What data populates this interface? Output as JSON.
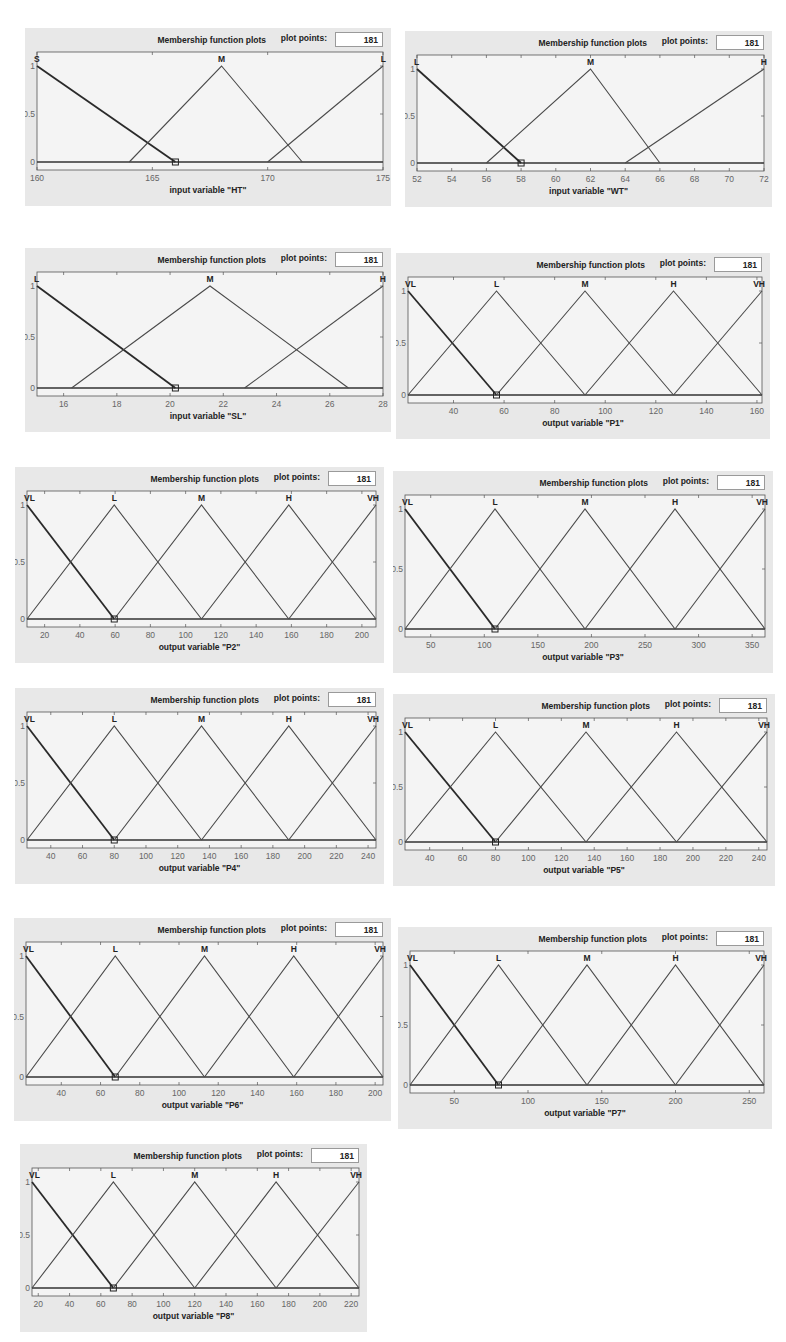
{
  "panel_common": {
    "header_title": "Membership function plots",
    "plot_points_label": "plot points:",
    "plot_points_value": "181"
  },
  "colors": {
    "panel_bg": "#e8e8e8",
    "plot_bg": "#f4f4f4",
    "line": "#4a4a4a",
    "text": "#222222"
  },
  "chart_data": [
    {
      "type": "line",
      "title": "Membership function plots",
      "xlabel": "input variable \"HT\"",
      "ylabel": "",
      "xlim": [
        160,
        175
      ],
      "ylim": [
        0,
        1
      ],
      "xticks": [
        160,
        165,
        170,
        175
      ],
      "yticks": [
        0,
        0.5,
        1
      ],
      "series": [
        {
          "name": "S",
          "points": [
            [
              160,
              1
            ],
            [
              166,
              0
            ]
          ]
        },
        {
          "name": "M",
          "points": [
            [
              164,
              0
            ],
            [
              168,
              1
            ],
            [
              171.5,
              0
            ]
          ]
        },
        {
          "name": "L",
          "points": [
            [
              170,
              0
            ],
            [
              175,
              1
            ]
          ]
        }
      ]
    },
    {
      "type": "line",
      "title": "Membership function plots",
      "xlabel": "input variable \"WT\"",
      "ylabel": "",
      "xlim": [
        52,
        72
      ],
      "ylim": [
        0,
        1
      ],
      "xticks": [
        52,
        54,
        56,
        58,
        60,
        62,
        64,
        66,
        68,
        70,
        72
      ],
      "yticks": [
        0,
        0.5,
        1
      ],
      "series": [
        {
          "name": "L",
          "points": [
            [
              52,
              1
            ],
            [
              58,
              0
            ]
          ]
        },
        {
          "name": "M",
          "points": [
            [
              56,
              0
            ],
            [
              62,
              1
            ],
            [
              66,
              0
            ]
          ]
        },
        {
          "name": "H",
          "points": [
            [
              64,
              0
            ],
            [
              72,
              1
            ]
          ]
        }
      ]
    },
    {
      "type": "line",
      "title": "Membership function plots",
      "xlabel": "input variable \"SL\"",
      "ylabel": "",
      "xlim": [
        15,
        28
      ],
      "ylim": [
        0,
        1
      ],
      "xticks": [
        16,
        18,
        20,
        22,
        24,
        26,
        28
      ],
      "yticks": [
        0,
        0.5,
        1
      ],
      "series": [
        {
          "name": "L",
          "points": [
            [
              15,
              1
            ],
            [
              20.2,
              0
            ]
          ]
        },
        {
          "name": "M",
          "points": [
            [
              16.3,
              0
            ],
            [
              21.5,
              1
            ],
            [
              26.7,
              0
            ]
          ]
        },
        {
          "name": "H",
          "points": [
            [
              22.8,
              0
            ],
            [
              28,
              1
            ]
          ]
        }
      ]
    },
    {
      "type": "line",
      "title": "Membership function plots",
      "xlabel": "output variable \"P1\"",
      "ylabel": "",
      "xlim": [
        22,
        162
      ],
      "ylim": [
        0,
        1
      ],
      "xticks": [
        40,
        60,
        80,
        100,
        120,
        140,
        160
      ],
      "yticks": [
        0,
        0.5,
        1
      ],
      "series": [
        {
          "name": "VL",
          "points": [
            [
              22,
              1
            ],
            [
              57,
              0
            ]
          ]
        },
        {
          "name": "L",
          "points": [
            [
              22,
              0
            ],
            [
              57,
              1
            ],
            [
              92,
              0
            ]
          ]
        },
        {
          "name": "M",
          "points": [
            [
              57,
              0
            ],
            [
              92,
              1
            ],
            [
              127,
              0
            ]
          ]
        },
        {
          "name": "H",
          "points": [
            [
              92,
              0
            ],
            [
              127,
              1
            ],
            [
              162,
              0
            ]
          ]
        },
        {
          "name": "VH",
          "points": [
            [
              127,
              0
            ],
            [
              162,
              1
            ]
          ]
        }
      ]
    },
    {
      "type": "line",
      "title": "Membership function plots",
      "xlabel": "output variable \"P2\"",
      "ylabel": "",
      "xlim": [
        10,
        208
      ],
      "ylim": [
        0,
        1
      ],
      "xticks": [
        20,
        40,
        60,
        80,
        100,
        120,
        140,
        160,
        180,
        200
      ],
      "yticks": [
        0,
        0.5,
        1
      ],
      "series": [
        {
          "name": "VL",
          "points": [
            [
              10,
              1
            ],
            [
              59.5,
              0
            ]
          ]
        },
        {
          "name": "L",
          "points": [
            [
              10,
              0
            ],
            [
              59.5,
              1
            ],
            [
              109,
              0
            ]
          ]
        },
        {
          "name": "M",
          "points": [
            [
              59.5,
              0
            ],
            [
              109,
              1
            ],
            [
              158.5,
              0
            ]
          ]
        },
        {
          "name": "H",
          "points": [
            [
              109,
              0
            ],
            [
              158.5,
              1
            ],
            [
              208,
              0
            ]
          ]
        },
        {
          "name": "VH",
          "points": [
            [
              158.5,
              0
            ],
            [
              208,
              1
            ]
          ]
        }
      ]
    },
    {
      "type": "line",
      "title": "Membership function plots",
      "xlabel": "output variable \"P3\"",
      "ylabel": "",
      "xlim": [
        26,
        362
      ],
      "ylim": [
        0,
        1
      ],
      "xticks": [
        50,
        100,
        150,
        200,
        250,
        300,
        350
      ],
      "yticks": [
        0,
        0.5,
        1
      ],
      "series": [
        {
          "name": "VL",
          "points": [
            [
              26,
              1
            ],
            [
              110,
              0
            ]
          ]
        },
        {
          "name": "L",
          "points": [
            [
              26,
              0
            ],
            [
              110,
              1
            ],
            [
              194,
              0
            ]
          ]
        },
        {
          "name": "M",
          "points": [
            [
              110,
              0
            ],
            [
              194,
              1
            ],
            [
              278,
              0
            ]
          ]
        },
        {
          "name": "H",
          "points": [
            [
              194,
              0
            ],
            [
              278,
              1
            ],
            [
              362,
              0
            ]
          ]
        },
        {
          "name": "VH",
          "points": [
            [
              278,
              0
            ],
            [
              362,
              1
            ]
          ]
        }
      ]
    },
    {
      "type": "line",
      "title": "Membership function plots",
      "xlabel": "output variable \"P4\"",
      "ylabel": "",
      "xlim": [
        25,
        245
      ],
      "ylim": [
        0,
        1
      ],
      "xticks": [
        40,
        60,
        80,
        100,
        120,
        140,
        160,
        180,
        200,
        220,
        240
      ],
      "yticks": [
        0,
        0.5,
        1
      ],
      "series": [
        {
          "name": "VL",
          "points": [
            [
              25,
              1
            ],
            [
              80,
              0
            ]
          ]
        },
        {
          "name": "L",
          "points": [
            [
              25,
              0
            ],
            [
              80,
              1
            ],
            [
              135,
              0
            ]
          ]
        },
        {
          "name": "M",
          "points": [
            [
              80,
              0
            ],
            [
              135,
              1
            ],
            [
              190,
              0
            ]
          ]
        },
        {
          "name": "H",
          "points": [
            [
              135,
              0
            ],
            [
              190,
              1
            ],
            [
              245,
              0
            ]
          ]
        },
        {
          "name": "VH",
          "points": [
            [
              190,
              0
            ],
            [
              245,
              1
            ]
          ]
        }
      ]
    },
    {
      "type": "line",
      "title": "Membership function plots",
      "xlabel": "output variable \"P5\"",
      "ylabel": "",
      "xlim": [
        25,
        245
      ],
      "ylim": [
        0,
        1
      ],
      "xticks": [
        40,
        60,
        80,
        100,
        120,
        140,
        160,
        180,
        200,
        220,
        240
      ],
      "yticks": [
        0,
        0.5,
        1
      ],
      "series": [
        {
          "name": "VL",
          "points": [
            [
              25,
              1
            ],
            [
              80,
              0
            ]
          ]
        },
        {
          "name": "L",
          "points": [
            [
              25,
              0
            ],
            [
              80,
              1
            ],
            [
              135,
              0
            ]
          ]
        },
        {
          "name": "M",
          "points": [
            [
              80,
              0
            ],
            [
              135,
              1
            ],
            [
              190,
              0
            ]
          ]
        },
        {
          "name": "H",
          "points": [
            [
              135,
              0
            ],
            [
              190,
              1
            ],
            [
              245,
              0
            ]
          ]
        },
        {
          "name": "VH",
          "points": [
            [
              190,
              0
            ],
            [
              245,
              1
            ]
          ]
        }
      ]
    },
    {
      "type": "line",
      "title": "Membership function plots",
      "xlabel": "output variable \"P6\"",
      "ylabel": "",
      "xlim": [
        22,
        204
      ],
      "ylim": [
        0,
        1
      ],
      "xticks": [
        40,
        60,
        80,
        100,
        120,
        140,
        160,
        180,
        200
      ],
      "yticks": [
        0,
        0.5,
        1
      ],
      "series": [
        {
          "name": "VL",
          "points": [
            [
              22,
              1
            ],
            [
              67.5,
              0
            ]
          ]
        },
        {
          "name": "L",
          "points": [
            [
              22,
              0
            ],
            [
              67.5,
              1
            ],
            [
              113,
              0
            ]
          ]
        },
        {
          "name": "M",
          "points": [
            [
              67.5,
              0
            ],
            [
              113,
              1
            ],
            [
              158.5,
              0
            ]
          ]
        },
        {
          "name": "H",
          "points": [
            [
              113,
              0
            ],
            [
              158.5,
              1
            ],
            [
              204,
              0
            ]
          ]
        },
        {
          "name": "VH",
          "points": [
            [
              158.5,
              0
            ],
            [
              204,
              1
            ]
          ]
        }
      ]
    },
    {
      "type": "line",
      "title": "Membership function plots",
      "xlabel": "output variable \"P7\"",
      "ylabel": "",
      "xlim": [
        20,
        260
      ],
      "ylim": [
        0,
        1
      ],
      "xticks": [
        50,
        100,
        150,
        200,
        250
      ],
      "yticks": [
        0,
        0.5,
        1
      ],
      "series": [
        {
          "name": "VL",
          "points": [
            [
              20,
              1
            ],
            [
              80,
              0
            ]
          ]
        },
        {
          "name": "L",
          "points": [
            [
              20,
              0
            ],
            [
              80,
              1
            ],
            [
              140,
              0
            ]
          ]
        },
        {
          "name": "M",
          "points": [
            [
              80,
              0
            ],
            [
              140,
              1
            ],
            [
              200,
              0
            ]
          ]
        },
        {
          "name": "H",
          "points": [
            [
              140,
              0
            ],
            [
              200,
              1
            ],
            [
              260,
              0
            ]
          ]
        },
        {
          "name": "VH",
          "points": [
            [
              200,
              0
            ],
            [
              260,
              1
            ]
          ]
        }
      ]
    },
    {
      "type": "line",
      "title": "Membership function plots",
      "xlabel": "output variable \"P8\"",
      "ylabel": "",
      "xlim": [
        16,
        225
      ],
      "ylim": [
        0,
        1
      ],
      "xticks": [
        20,
        40,
        60,
        80,
        100,
        120,
        140,
        160,
        180,
        200,
        220
      ],
      "yticks": [
        0,
        0.5,
        1
      ],
      "series": [
        {
          "name": "VL",
          "points": [
            [
              16,
              1
            ],
            [
              68,
              0
            ]
          ]
        },
        {
          "name": "L",
          "points": [
            [
              16,
              0
            ],
            [
              68,
              1
            ],
            [
              120,
              0
            ]
          ]
        },
        {
          "name": "M",
          "points": [
            [
              68,
              0
            ],
            [
              120,
              1
            ],
            [
              172,
              0
            ]
          ]
        },
        {
          "name": "H",
          "points": [
            [
              120,
              0
            ],
            [
              172,
              1
            ],
            [
              225,
              0
            ]
          ]
        },
        {
          "name": "VH",
          "points": [
            [
              172,
              0
            ],
            [
              225,
              1
            ]
          ]
        }
      ]
    }
  ],
  "panels": [
    {
      "id": "HT",
      "x": 25,
      "y": 28,
      "w": 366,
      "h": 178
    },
    {
      "id": "WT",
      "x": 405,
      "y": 31,
      "w": 367,
      "h": 176
    },
    {
      "id": "SL",
      "x": 25,
      "y": 248,
      "w": 366,
      "h": 184
    },
    {
      "id": "P1",
      "x": 396,
      "y": 253,
      "w": 374,
      "h": 186
    },
    {
      "id": "P2",
      "x": 15,
      "y": 467,
      "w": 369,
      "h": 196
    },
    {
      "id": "P3",
      "x": 393,
      "y": 471,
      "w": 380,
      "h": 202
    },
    {
      "id": "P4",
      "x": 15,
      "y": 688,
      "w": 369,
      "h": 196
    },
    {
      "id": "P5",
      "x": 393,
      "y": 694,
      "w": 382,
      "h": 192
    },
    {
      "id": "P6",
      "x": 14,
      "y": 918,
      "w": 377,
      "h": 203
    },
    {
      "id": "P7",
      "x": 398,
      "y": 927,
      "w": 374,
      "h": 202
    },
    {
      "id": "P8",
      "x": 20,
      "y": 1144,
      "w": 347,
      "h": 188
    }
  ]
}
